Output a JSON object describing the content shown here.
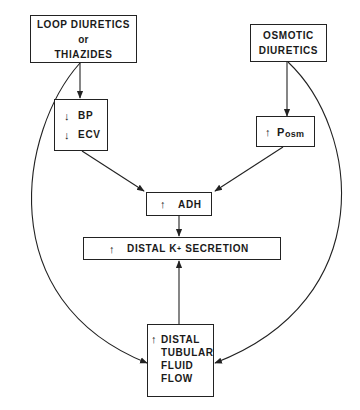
{
  "diagram": {
    "type": "flowchart",
    "nodes": {
      "loop_diuretics": {
        "line1": "LOOP DIURETICS",
        "line2": "or",
        "line3": "THIAZIDES"
      },
      "osmotic_diuretics": {
        "line1": "OSMOTIC",
        "line2": "DIURETICS"
      },
      "bp_ecv": {
        "items": [
          {
            "arrow": "↓",
            "label": "BP"
          },
          {
            "arrow": "↓",
            "label": "ECV"
          }
        ]
      },
      "posm": {
        "arrow": "↑",
        "label": "P",
        "subscript": "osm"
      },
      "adh": {
        "arrow": "↑",
        "label": "ADH"
      },
      "k_secretion": {
        "arrow": "↑",
        "label_pre": "DISTAL K",
        "superscript": "+",
        "label_post": " SECRETION"
      },
      "distal_flow": {
        "arrow": "↑",
        "line1": "DISTAL",
        "line2": "TUBULAR",
        "line3": "FLUID",
        "line4": "FLOW"
      }
    },
    "edges": [
      {
        "from": "loop_diuretics",
        "to": "bp_ecv",
        "style": "straight"
      },
      {
        "from": "loop_diuretics",
        "to": "distal_flow",
        "style": "curved"
      },
      {
        "from": "osmotic_diuretics",
        "to": "posm",
        "style": "straight"
      },
      {
        "from": "osmotic_diuretics",
        "to": "distal_flow",
        "style": "curved"
      },
      {
        "from": "bp_ecv",
        "to": "adh",
        "style": "straight"
      },
      {
        "from": "posm",
        "to": "adh",
        "style": "straight"
      },
      {
        "from": "adh",
        "to": "k_secretion",
        "style": "straight"
      },
      {
        "from": "distal_flow",
        "to": "k_secretion",
        "style": "straight"
      }
    ],
    "colors": {
      "line": "#222222",
      "background": "#ffffff"
    }
  }
}
